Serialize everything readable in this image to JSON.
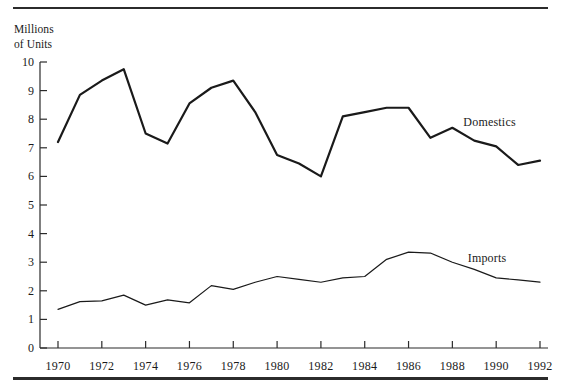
{
  "figure": {
    "y_axis_title": "Millions\nof Units",
    "rules": {
      "top": "horizontal-rule",
      "bottom": "horizontal-rule-thick"
    }
  },
  "chart_data": {
    "type": "line",
    "title": "",
    "subtitle": "",
    "xlabel": "",
    "ylabel": "Millions of Units",
    "xlim": [
      1969.4,
      1992.6
    ],
    "ylim": [
      0,
      10
    ],
    "grid": false,
    "legend_position": "inline-right",
    "y_ticks": [
      0,
      1,
      2,
      3,
      4,
      5,
      6,
      7,
      8,
      9,
      10
    ],
    "y_tick_labels": [
      "0",
      "1",
      "2",
      "3",
      "4",
      "5",
      "6",
      "7",
      "8",
      "9",
      "10"
    ],
    "x_ticks": [
      1970,
      1971,
      1972,
      1973,
      1974,
      1975,
      1976,
      1977,
      1978,
      1979,
      1980,
      1981,
      1982,
      1983,
      1984,
      1985,
      1986,
      1987,
      1988,
      1989,
      1990,
      1991,
      1992
    ],
    "x_tick_labels_shown": [
      "1970",
      "1972",
      "1974",
      "1976",
      "1978",
      "1980",
      "1982",
      "1984",
      "1986",
      "1988",
      "1990",
      "1992"
    ],
    "x": [
      1970,
      1971,
      1972,
      1973,
      1974,
      1975,
      1976,
      1977,
      1978,
      1979,
      1980,
      1981,
      1982,
      1983,
      1984,
      1985,
      1986,
      1987,
      1988,
      1989,
      1990,
      1991,
      1992
    ],
    "series": [
      {
        "name": "Domestics",
        "color": "#1a1a1a",
        "line_width": 2.2,
        "label_x": 1988.5,
        "label_y": 7.9,
        "values": [
          7.2,
          8.85,
          9.35,
          9.75,
          7.5,
          7.15,
          8.55,
          9.1,
          9.35,
          8.25,
          6.75,
          6.45,
          6.0,
          8.1,
          8.25,
          8.4,
          8.4,
          7.35,
          7.7,
          7.25,
          7.05,
          6.4,
          6.55
        ]
      },
      {
        "name": "Imports",
        "color": "#1a1a1a",
        "line_width": 1.2,
        "label_x": 1988.7,
        "label_y": 3.15,
        "values": [
          1.35,
          1.62,
          1.65,
          1.85,
          1.5,
          1.68,
          1.58,
          2.18,
          2.05,
          2.3,
          2.5,
          2.4,
          2.3,
          2.45,
          2.5,
          3.1,
          3.35,
          3.32,
          3.0,
          2.75,
          2.45,
          2.38,
          2.3
        ]
      }
    ]
  }
}
